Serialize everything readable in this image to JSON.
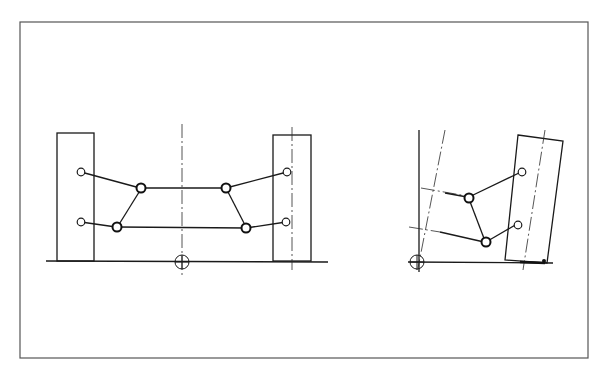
{
  "figure": {
    "type": "technical line drawing",
    "text_labels": []
  },
  "colors": {
    "background": "#ffffff",
    "line": "#1a1a1a",
    "frame": "#555555"
  },
  "frame": {
    "x": 20,
    "y": 22,
    "width": 568,
    "height": 336
  },
  "views": [
    {
      "name": "front-view-level",
      "ground_y": 261,
      "wheels": [
        {
          "x": 57,
          "y": 133,
          "w": 37,
          "h": 128
        },
        {
          "x": 273,
          "y": 135,
          "w": 38,
          "h": 126
        }
      ],
      "center_marker": {
        "cx": 182,
        "cy": 262,
        "r": 7
      }
    },
    {
      "name": "front-view-roll",
      "ground_y": 263,
      "wheel_tilted": true,
      "center_marker": {
        "cx": 417,
        "cy": 262,
        "r": 7
      }
    }
  ]
}
